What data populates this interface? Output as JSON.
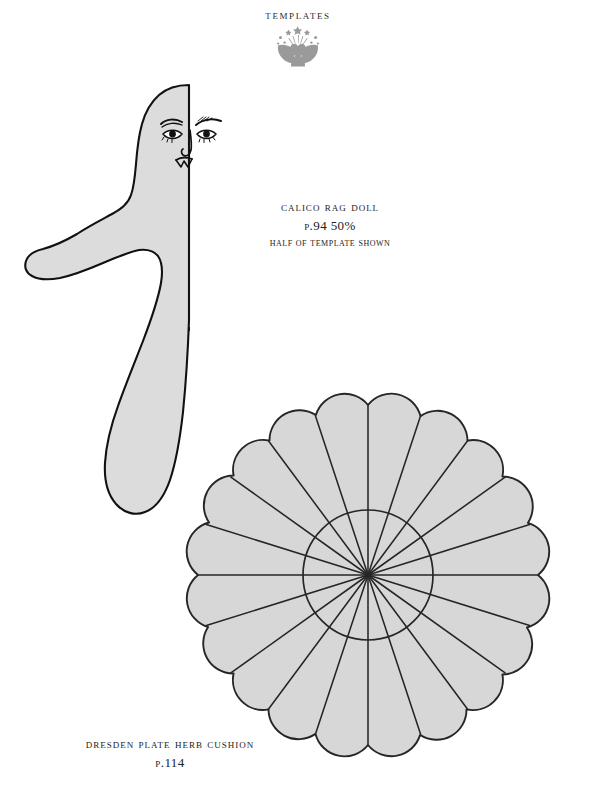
{
  "page": {
    "width": 596,
    "height": 803,
    "background": "#ffffff",
    "kind": "craft-book-template-sheet"
  },
  "header": {
    "title": "Templates",
    "ornament_icon": "floral-leaf-ornament",
    "ornament_color": "#9a9a9a"
  },
  "captions": {
    "doll": {
      "name": "Calico Rag Doll",
      "page_and_scale": "p.94 50%",
      "note": "Half of Template shown"
    },
    "cushion": {
      "name": "Dresden Plate Herb Cushion",
      "page": "p.114"
    }
  },
  "colors": {
    "outline": "#111111",
    "doll_fill": "#dcdcdc",
    "plate_fill": "#d7d7d7",
    "plate_line": "#262626",
    "fold_line": "#111111",
    "text": "#222222"
  },
  "templates": [
    {
      "id": "calico-rag-doll",
      "label": "Calico Rag Doll",
      "shape": "half body silhouette with face",
      "fold_line": {
        "style": "dashed",
        "x": 189,
        "y_top": 85,
        "y_bottom": 331
      },
      "face": {
        "features": [
          "left-eye",
          "right-eye",
          "left-eyebrow",
          "right-eyebrow",
          "nose",
          "mouth"
        ]
      }
    },
    {
      "id": "dresden-plate-herb-cushion",
      "label": "Dresden Plate Herb Cushion",
      "shape": "scalloped circle divided into radial wedges",
      "center": {
        "x": 368,
        "y": 575
      },
      "peak_radius": 190,
      "valley_radius": 170,
      "inner_circle_radius": 65,
      "segments": 20
    }
  ]
}
